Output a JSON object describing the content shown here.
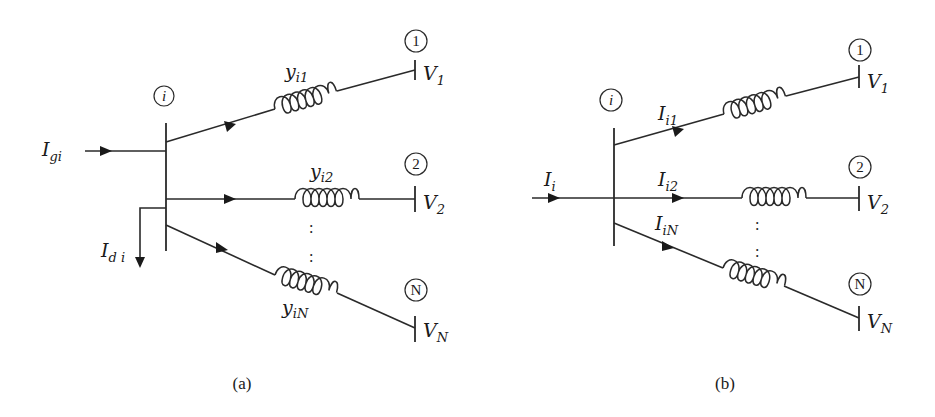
{
  "diagram_a": {
    "caption": "(a)",
    "bus_node": "i",
    "injection": {
      "main": "I",
      "sub": "gi"
    },
    "load": {
      "main": "I",
      "sub": "d i"
    },
    "branches": [
      {
        "admittance": {
          "main": "y",
          "sub": "i1"
        },
        "node": "1",
        "voltage": {
          "main": "V",
          "sub": "1"
        }
      },
      {
        "admittance": {
          "main": "y",
          "sub": "i2"
        },
        "node": "2",
        "voltage": {
          "main": "V",
          "sub": "2"
        }
      },
      {
        "admittance": {
          "main": "y",
          "sub": "iN"
        },
        "node": "N",
        "voltage": {
          "main": "V",
          "sub": "N"
        }
      }
    ],
    "ellipsis": ":"
  },
  "diagram_b": {
    "caption": "(b)",
    "bus_node": "i",
    "injection": {
      "main": "I",
      "sub": "i"
    },
    "branches": [
      {
        "current": {
          "main": "I",
          "sub": "i1"
        },
        "node": "1",
        "voltage": {
          "main": "V",
          "sub": "1"
        }
      },
      {
        "current": {
          "main": "I",
          "sub": "i2"
        },
        "node": "2",
        "voltage": {
          "main": "V",
          "sub": "2"
        }
      },
      {
        "current": {
          "main": "I",
          "sub": "iN"
        },
        "node": "N",
        "voltage": {
          "main": "V",
          "sub": "N"
        }
      }
    ],
    "ellipsis": ":"
  },
  "colors": {
    "line": "#2a2a2a",
    "background": "#ffffff"
  }
}
